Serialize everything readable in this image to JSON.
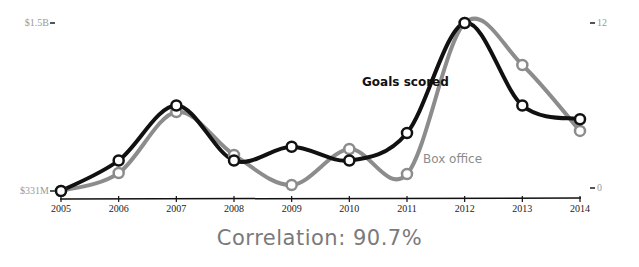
{
  "chart_data": {
    "type": "line",
    "title": "",
    "x": [
      "2005",
      "2006",
      "2007",
      "2008",
      "2009",
      "2010",
      "2011",
      "2012",
      "2013",
      "2014"
    ],
    "series": [
      {
        "name": "Goals scored",
        "axis": "right",
        "color": "#111111",
        "values": [
          0,
          2,
          6,
          2,
          3,
          2,
          4,
          12,
          6,
          5
        ]
      },
      {
        "name": "Box office",
        "axis": "left",
        "color": "#8c8c8c",
        "unit": "USD millions",
        "values": [
          331,
          456,
          881,
          582,
          373,
          623,
          449,
          1500,
          1208,
          749
        ]
      }
    ],
    "left_axis": {
      "ticks": [
        "$331M",
        "$1.5B"
      ],
      "range": [
        331,
        1500
      ]
    },
    "right_axis": {
      "ticks": [
        "0",
        "12"
      ],
      "range": [
        0,
        12
      ]
    },
    "xlabel": "",
    "grid": false,
    "annotations": [
      "Goals scored",
      "Box office",
      "Correlation: 90.7%"
    ]
  },
  "labels": {
    "left_top": "$1.5B",
    "left_bottom": "$331M",
    "right_top": "12",
    "right_bottom": "0",
    "goals": "Goals scored",
    "box_office": "Box office",
    "correlation": "Correlation: 90.7%"
  }
}
